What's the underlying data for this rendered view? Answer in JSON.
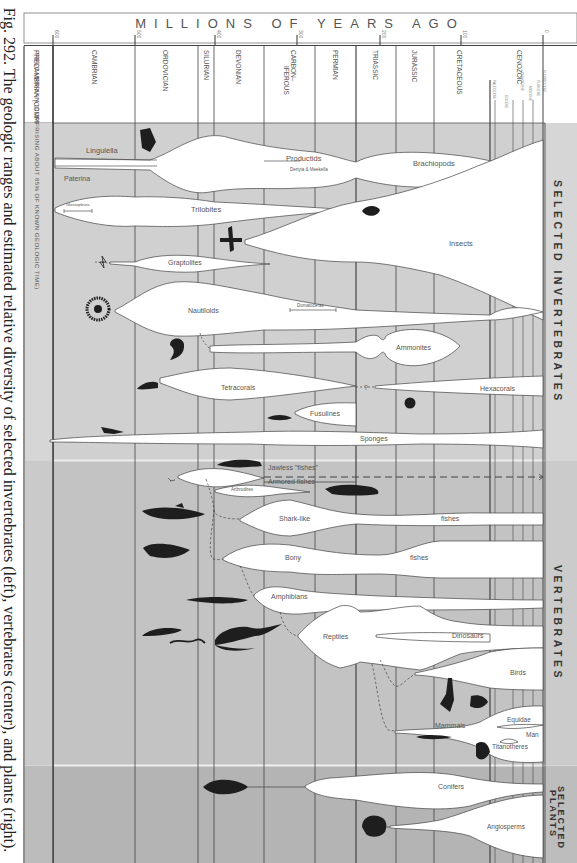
{
  "caption": "Fig. 292. The geologic ranges and estimated relative diversity of selected invertebrates (left), vertebrates (center), and plants (right).",
  "header": {
    "axis_title": "MILLIONS OF YEARS AGO",
    "ticks": [
      {
        "label": "600",
        "x": 53
      },
      {
        "label": "500",
        "x": 135
      },
      {
        "label": "400",
        "x": 215
      },
      {
        "label": "300",
        "x": 297
      },
      {
        "label": "200",
        "x": 380
      },
      {
        "label": "100",
        "x": 461
      },
      {
        "label": "0",
        "x": 543
      }
    ]
  },
  "periods": [
    {
      "name": "PRECAMBRIAN (COMPRISING ABOUT 85% OF KNOWN GEOLOGIC TIME)",
      "x0": 24,
      "x1": 53
    },
    {
      "name": "CAMBRIAN",
      "x0": 53,
      "x1": 135
    },
    {
      "name": "ORDOVICIAN",
      "x0": 135,
      "x1": 198
    },
    {
      "name": "SILURIAN",
      "x0": 198,
      "x1": 215
    },
    {
      "name": "DEVONIAN",
      "x0": 215,
      "x1": 264
    },
    {
      "name": "CARBON-IFEROUS",
      "x0": 264,
      "x1": 315
    },
    {
      "name": "PERMIAN",
      "x0": 315,
      "x1": 356
    },
    {
      "name": "TRIASSIC",
      "x0": 356,
      "x1": 396
    },
    {
      "name": "JURASSIC",
      "x0": 396,
      "x1": 434
    },
    {
      "name": "CRETACEOUS",
      "x0": 434,
      "x1": 490
    },
    {
      "name": "CENOZOIC",
      "x0": 490,
      "x1": 545
    }
  ],
  "cenozoic_epochs": [
    "PALEOCENE",
    "EOCENE",
    "OLIGOCENE",
    "MIOCENE",
    "PLIOCENE",
    "PLEISTOCENE"
  ],
  "sections": [
    {
      "name": "SELECTED INVERTEBRATES",
      "y0": 123,
      "y1": 460
    },
    {
      "name": "VERTEBRATES",
      "y0": 460,
      "y1": 765
    },
    {
      "name": "SELECTED PLANTS",
      "y0": 765,
      "y1": 863
    }
  ],
  "groups": {
    "invertebrates": [
      "Lingulella",
      "Paterina",
      "Productids",
      "Dertyia & Meekella",
      "Brachiopods",
      "Glossopleura",
      "Trilobites",
      "Insects",
      "Graptolites",
      "Nautiloids",
      "Domatoceras",
      "Ammonites",
      "Tetracorals",
      "Hexacorals",
      "Fusulines",
      "Sponges"
    ],
    "vertebrates": [
      "Jawless \"fishes\"",
      "Armored fishes",
      "Arthrodires",
      "Shark-like",
      "fishes",
      "Bony",
      "fishes",
      "Amphibians",
      "Reptiles",
      "Dinosaurs",
      "Birds",
      "Mammals",
      "Equidae",
      "Man",
      "Titanotheres"
    ],
    "plants": [
      "Conifers",
      "Angiosperms"
    ]
  },
  "labels": {
    "lingulella": "Lingulella",
    "paterina": "Paterina",
    "productids": "Productids",
    "dertyia": "Dertyia & Meekella",
    "brachiopods": "Brachiopods",
    "glossopleura": "Glossopleura",
    "trilobites": "Trilobites",
    "insects": "Insects",
    "graptolites": "Graptolites",
    "nautiloids": "Nautiloids",
    "domatoceras": "Domatoceras",
    "ammonites": "Ammonites",
    "tetracorals": "Tetracorals",
    "question": "?",
    "hexacorals": "Hexacorals",
    "fusulines": "Fusulines",
    "sponges": "Sponges",
    "jawless": "Jawless \"fishes\"",
    "armored": "Armored fishes",
    "arthrodires": "Arthrodires",
    "sharklike": "Shark-like",
    "fishes1": "fishes",
    "bony": "Bony",
    "fishes2": "fishes",
    "amphibians": "Amphibians",
    "reptiles": "Reptiles",
    "dinosaurs": "Dinosaurs",
    "birds": "Birds",
    "mammals": "Mammals",
    "equidae": "Equidae",
    "man": "Man",
    "titanotheres": "Titanotheres",
    "conifers": "Conifers",
    "angiosperms": "Angiosperms"
  },
  "side_labels": {
    "invertebrates": "SELECTED INVERTEBRATES",
    "vertebrates": "VERTEBRATES",
    "plants_1": "SELECTED",
    "plants_2": "PLANTS"
  },
  "colors": {
    "band_light": "#cfcfcf",
    "band_mid": "#c4c4c4",
    "band_dark": "#b5b5b5",
    "spindle": "#ffffff",
    "line": "#444444",
    "silhouette": "#1e1e1e"
  }
}
